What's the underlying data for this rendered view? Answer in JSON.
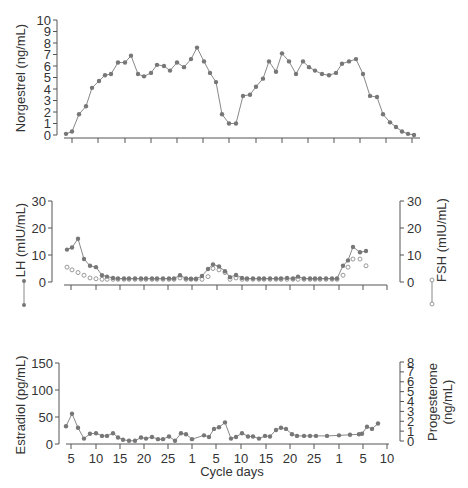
{
  "chart_data": [
    {
      "type": "line",
      "panel": "top",
      "title": "",
      "ylabel": "Norgestrel (ng/mL)",
      "ylim": [
        0,
        10
      ],
      "yticks": [
        0,
        1,
        2,
        3,
        4,
        5,
        6,
        7,
        8,
        9,
        10
      ],
      "marker_color": "#777777",
      "series": [
        {
          "name": "Norgestrel",
          "marker": "filled-circle",
          "points_px_x": [
            66,
            72,
            79,
            86,
            92,
            99,
            105,
            111,
            118,
            125,
            131,
            138,
            144,
            151,
            157,
            164,
            170,
            177,
            184,
            191,
            197,
            204,
            210,
            216,
            222,
            229,
            236,
            243,
            250,
            256,
            263,
            269,
            276,
            282,
            289,
            296,
            303,
            309,
            315,
            322,
            329,
            336,
            342,
            349,
            356,
            363,
            370,
            377,
            383,
            390,
            396,
            402,
            408,
            414
          ],
          "values": [
            0.1,
            0.3,
            1.8,
            2.5,
            4.1,
            4.7,
            5.2,
            5.3,
            6.3,
            6.3,
            6.9,
            5.3,
            5.1,
            5.4,
            6.1,
            6.0,
            5.6,
            6.3,
            5.9,
            6.6,
            7.6,
            6.4,
            5.4,
            4.6,
            1.8,
            1.0,
            1.0,
            3.4,
            3.5,
            4.2,
            4.9,
            6.4,
            5.5,
            7.1,
            6.4,
            5.3,
            6.4,
            5.9,
            5.6,
            5.3,
            5.2,
            5.4,
            6.2,
            6.4,
            6.6,
            5.3,
            3.4,
            3.3,
            1.8,
            1.1,
            0.7,
            0.3,
            0.1,
            0.0
          ]
        }
      ]
    },
    {
      "type": "line",
      "panel": "middle",
      "ylabel": "LH (mIU/mL)",
      "ylabel_right": "FSH (mIU/mL)",
      "ylim": [
        0,
        30
      ],
      "yticks": [
        0,
        10,
        20,
        30
      ],
      "yticks_right": [
        0,
        10,
        20,
        30
      ],
      "series": [
        {
          "name": "LH",
          "marker": "filled-circle-connected",
          "points_px_x": [
            67,
            72,
            78,
            84,
            90,
            96,
            102,
            107,
            113,
            118,
            124,
            129,
            135,
            141,
            146,
            152,
            157,
            163,
            169,
            174,
            180,
            186,
            191,
            196,
            202,
            208,
            213,
            219,
            225,
            230,
            236,
            242,
            247,
            253,
            259,
            264,
            270,
            276,
            281,
            287,
            293,
            298,
            304,
            310,
            315,
            320,
            326,
            332,
            337,
            343,
            348,
            353,
            360,
            366
          ],
          "values": [
            12,
            12.8,
            16,
            8.5,
            6,
            5.5,
            2.5,
            2,
            1.5,
            1.3,
            1.3,
            1.3,
            1.3,
            1.3,
            1.3,
            1.3,
            1.3,
            1.3,
            1.3,
            1.3,
            2.5,
            1.3,
            1.2,
            1.2,
            2.2,
            4.8,
            6.5,
            5.8,
            4,
            1.8,
            2.6,
            1.5,
            1.3,
            1.3,
            1.3,
            1.3,
            1.3,
            1.3,
            1.3,
            1.5,
            1.3,
            2,
            1.3,
            1.3,
            1.3,
            1.3,
            1.3,
            1.3,
            1.3,
            6,
            8,
            13,
            11,
            11.5
          ]
        },
        {
          "name": "FSH",
          "marker": "open-circle",
          "points_px_x": [
            67,
            72,
            78,
            84,
            90,
            96,
            102,
            107,
            113,
            118,
            124,
            129,
            135,
            141,
            146,
            152,
            157,
            163,
            169,
            174,
            180,
            186,
            191,
            196,
            202,
            208,
            213,
            219,
            225,
            230,
            236,
            242,
            247,
            253,
            259,
            264,
            270,
            276,
            281,
            287,
            293,
            298,
            304,
            310,
            315,
            320,
            326,
            332,
            337,
            343,
            348,
            353,
            360,
            366
          ],
          "values": [
            5.5,
            4.5,
            3.5,
            2.5,
            1.5,
            1.2,
            1,
            1,
            1,
            1,
            1,
            1,
            1,
            1,
            1,
            1,
            1,
            1,
            1,
            1,
            1.5,
            1,
            1,
            1,
            1,
            2,
            5,
            4.5,
            3.5,
            1,
            1.5,
            1,
            1,
            1,
            1,
            1,
            1,
            1,
            1,
            1,
            1,
            1,
            1,
            1,
            1,
            1,
            1,
            1,
            1,
            2.5,
            5.5,
            8.5,
            8.5,
            6
          ]
        }
      ],
      "legend_symbols": {
        "left": "filled-circle-connected (LH)",
        "right": "open-circle-connected (FSH)"
      }
    },
    {
      "type": "line",
      "panel": "bottom",
      "xlabel": "Cycle days",
      "ylabel": "Estradiol (pg/mL)",
      "ylabel_right": "Progesterone (ng/mL)",
      "ylim": [
        0,
        150
      ],
      "ylim_right": [
        0,
        8
      ],
      "yticks": [
        0,
        50,
        100,
        150
      ],
      "yticks_right": [
        0,
        1,
        2,
        3,
        4,
        5,
        6,
        7,
        8
      ],
      "xtick_labels": [
        "5",
        "10",
        "15",
        "20",
        "25",
        "1",
        "5",
        "10",
        "15",
        "20",
        "25",
        "1",
        "5",
        "10"
      ],
      "series": [
        {
          "name": "Estradiol / Progesterone combined trace",
          "marker": "filled-circle",
          "points_px_x": [
            66,
            72,
            78,
            84,
            90,
            96,
            102,
            107,
            113,
            118,
            123,
            129,
            135,
            141,
            146,
            152,
            158,
            163,
            169,
            175,
            181,
            186,
            192,
            204,
            209,
            214,
            219,
            225,
            231,
            236,
            242,
            248,
            253,
            259,
            265,
            270,
            276,
            281,
            286,
            292,
            297,
            304,
            310,
            316,
            327,
            339,
            350,
            359,
            362,
            367,
            372,
            378
          ],
          "values_estradiol_pg_ml": [
            33,
            56,
            30,
            10,
            19,
            20,
            15,
            15,
            20,
            12,
            8,
            6,
            6,
            12,
            10,
            13,
            9,
            9,
            14,
            6,
            20,
            18,
            9,
            16,
            13,
            28,
            31,
            40,
            10,
            13,
            20,
            14,
            14,
            10,
            15,
            14,
            26,
            30,
            28,
            18,
            15,
            15,
            15,
            15,
            15,
            16,
            17,
            18,
            19,
            32,
            28,
            38
          ]
        }
      ]
    }
  ],
  "labels": {
    "top_ylabel": "Norgestrel (ng/mL)",
    "mid_ylabel_left": "LH (mIU/mL)",
    "mid_ylabel_right": "FSH (mIU/mL)",
    "bot_ylabel_left": "Estradiol (pg/mL)",
    "bot_ylabel_right_1": "Progesterone",
    "bot_ylabel_right_2": "(ng/mL)",
    "xlabel": "Cycle days"
  },
  "ticks": {
    "top_y": [
      "0",
      "1",
      "2",
      "3",
      "4",
      "5",
      "6",
      "7",
      "8",
      "9",
      "10"
    ],
    "mid_y_left": [
      "0",
      "10",
      "20",
      "30"
    ],
    "mid_y_right": [
      "0",
      "10",
      "20",
      "30"
    ],
    "bot_y_left": [
      "0",
      "50",
      "100",
      "150"
    ],
    "bot_y_right": [
      "0",
      "1",
      "2",
      "3",
      "4",
      "5",
      "6",
      "7",
      "8"
    ],
    "bot_x": [
      "5",
      "10",
      "15",
      "20",
      "25",
      "1",
      "5",
      "10",
      "15",
      "20",
      "25",
      "1",
      "5",
      "10"
    ]
  }
}
